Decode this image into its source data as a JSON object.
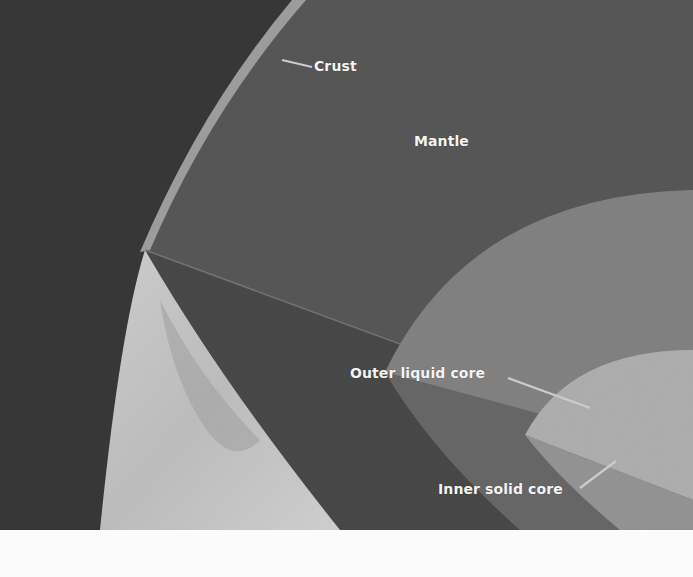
{
  "diagram": {
    "labels": {
      "crust": "Crust",
      "mantle": "Mantle",
      "outer_core": "Outer liquid core",
      "inner_core": "Inner solid core"
    },
    "layers": [
      {
        "name": "space",
        "color": "#0d0d0d"
      },
      {
        "name": "crust",
        "color": "#a8a8a8"
      },
      {
        "name": "mantle",
        "color": "#3c3c3c"
      },
      {
        "name": "mantle-shadow-face",
        "color": "#262626"
      },
      {
        "name": "outer-liquid-core",
        "color": "#7e7e7e"
      },
      {
        "name": "inner-solid-core",
        "color": "#c2c2c2"
      },
      {
        "name": "surface",
        "color": "#e6e6e6"
      }
    ]
  }
}
